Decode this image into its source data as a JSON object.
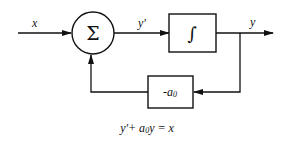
{
  "diagram": {
    "type": "block-diagram",
    "signals": {
      "input": "x",
      "derivative": "y'",
      "output": "y"
    },
    "blocks": {
      "summer": {
        "symbol": "Σ",
        "shape": "circle"
      },
      "integrator": {
        "symbol": "∫",
        "shape": "rectangle"
      },
      "gain": {
        "label_prefix": "-a",
        "label_sub": "0",
        "shape": "rectangle"
      }
    },
    "equation": {
      "part1": "y'+ a",
      "sub": "0",
      "part2": "y = x"
    },
    "colors": {
      "stroke": "#111111",
      "background": "#ffffff"
    }
  }
}
